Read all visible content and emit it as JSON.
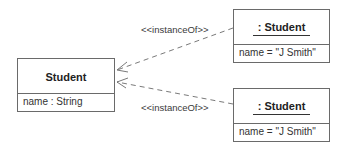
{
  "diagram": {
    "type": "UML object diagram",
    "class_box": {
      "name": "Student",
      "attribute": "name : String"
    },
    "objects": [
      {
        "name": ": Student",
        "attribute": "name = \"J Smith\""
      },
      {
        "name": ": Student",
        "attribute": "name = \"J Smith\""
      }
    ],
    "relations": [
      {
        "label": "<<instanceOf>>",
        "from": "objects.0",
        "to": "class_box",
        "style": "dashed",
        "arrow": "open"
      },
      {
        "label": "<<instanceOf>>",
        "from": "objects.1",
        "to": "class_box",
        "style": "dashed",
        "arrow": "open"
      }
    ],
    "colors": {
      "line": "#6a6a6a",
      "text": "#2a2a2a",
      "background": "#ffffff"
    }
  }
}
